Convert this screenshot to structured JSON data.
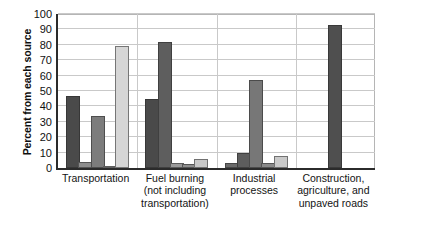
{
  "chart_data": {
    "type": "bar",
    "title": "",
    "subtitle": "",
    "xlabel": "",
    "ylabel": "Percent from each source",
    "ylim": [
      0,
      100
    ],
    "y_ticks": [
      0,
      10,
      20,
      30,
      40,
      50,
      60,
      70,
      80,
      90,
      100
    ],
    "grid": true,
    "legend_position": "none",
    "categories": [
      "Transportation",
      "Fuel burning (not including transportation)",
      "Industrial processes",
      "Construction, agriculture, and unpaved roads"
    ],
    "category_lines": [
      [
        "Transportation"
      ],
      [
        "Fuel burning",
        "(not including",
        "transportation)"
      ],
      [
        "Industrial",
        "processes"
      ],
      [
        "Construction,",
        "agriculture, and",
        "unpaved roads"
      ]
    ],
    "series": [
      {
        "name": "Series 1",
        "color": "#4a4a4a",
        "values": [
          47,
          45,
          3,
          0
        ]
      },
      {
        "name": "Series 2",
        "color": "#6e6e6e",
        "values": [
          4,
          82,
          10,
          0
        ]
      },
      {
        "name": "Series 3",
        "color": "#8a8a8a",
        "values": [
          34,
          3,
          57,
          0
        ]
      },
      {
        "name": "Series 4",
        "color": "#a9a9a9",
        "values": [
          1.5,
          2.5,
          3,
          0
        ]
      },
      {
        "name": "Series 5",
        "color": "#d2d2d2",
        "values": [
          79,
          6,
          8,
          93
        ]
      }
    ],
    "bars_per_group": [
      {
        "group": "Transportation",
        "values": [
          47,
          4,
          34,
          1.5,
          79
        ],
        "colors": [
          "#4a4a4a",
          "#8d8d8d",
          "#7c7c7c",
          "#9d9d9d",
          "#d6d6d6"
        ]
      },
      {
        "group": "Fuel burning (not including transportation)",
        "values": [
          45,
          82,
          3,
          2.5,
          6
        ],
        "colors": [
          "#4a4a4a",
          "#5e5e5e",
          "#9a9a9a",
          "#8f8f8f",
          "#c8c8c8"
        ]
      },
      {
        "group": "Industrial processes",
        "values": [
          3,
          10,
          57,
          3,
          8
        ],
        "colors": [
          "#6a6a6a",
          "#5d5d5d",
          "#777777",
          "#8a8a8a",
          "#c9c9c9"
        ]
      },
      {
        "group": "Construction, agriculture, and unpaved roads",
        "values": [
          93
        ],
        "colors": [
          "#4f4f4f"
        ]
      }
    ]
  },
  "axis": {
    "y_title": "Percent from each source",
    "tick_labels": [
      "100",
      "90",
      "80",
      "70",
      "60",
      "50",
      "40",
      "30",
      "20",
      "10",
      "0"
    ]
  },
  "colors": {
    "axis_line": "#2b2b2b",
    "gridline": "#c9c9c9",
    "text": "#111111",
    "background": "#ffffff"
  }
}
